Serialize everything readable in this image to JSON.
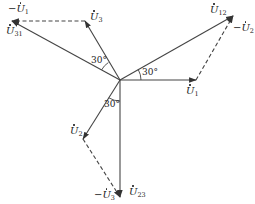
{
  "diagram": {
    "type": "phasor-diagram",
    "origin": [
      120,
      80
    ],
    "stroke_color": "#444444",
    "phasors": [
      {
        "id": "U1",
        "label_prefix": "",
        "label_sub": "1",
        "from": [
          120,
          80
        ],
        "to": [
          196,
          80
        ],
        "style": "solid"
      },
      {
        "id": "U2",
        "label_prefix": "",
        "label_sub": "2",
        "from": [
          120,
          80
        ],
        "to": [
          83,
          139
        ],
        "style": "solid"
      },
      {
        "id": "U3",
        "label_prefix": "",
        "label_sub": "3",
        "from": [
          120,
          80
        ],
        "to": [
          85,
          21
        ],
        "style": "solid"
      },
      {
        "id": "U12",
        "label_prefix": "",
        "label_sub": "12",
        "from": [
          120,
          80
        ],
        "to": [
          233,
          16
        ],
        "style": "solid"
      },
      {
        "id": "U23",
        "label_prefix": "",
        "label_sub": "23",
        "from": [
          120,
          80
        ],
        "to": [
          120,
          197
        ],
        "style": "solid"
      },
      {
        "id": "U31",
        "label_prefix": "",
        "label_sub": "31",
        "from": [
          120,
          80
        ],
        "to": [
          12,
          21
        ],
        "style": "solid"
      },
      {
        "id": "-U2",
        "label_prefix": "−",
        "label_sub": "2",
        "from": [
          196,
          80
        ],
        "to": [
          233,
          16
        ],
        "style": "dashed"
      },
      {
        "id": "-U3",
        "label_prefix": "−",
        "label_sub": "3",
        "from": [
          83,
          139
        ],
        "to": [
          120,
          197
        ],
        "style": "dashed"
      },
      {
        "id": "-U1",
        "label_prefix": "−",
        "label_sub": "1",
        "from": [
          85,
          21
        ],
        "to": [
          12,
          21
        ],
        "style": "dashed"
      }
    ],
    "labels": {
      "neg_u1": {
        "prefix": "−",
        "sub": "1"
      },
      "u31": {
        "prefix": "",
        "sub": "31"
      },
      "u3": {
        "prefix": "",
        "sub": "3"
      },
      "u12": {
        "prefix": "",
        "sub": "12"
      },
      "neg_u2": {
        "prefix": "−",
        "sub": "2"
      },
      "u1": {
        "prefix": "",
        "sub": "1"
      },
      "u2": {
        "prefix": "",
        "sub": "2"
      },
      "neg_u3": {
        "prefix": "−",
        "sub": "3"
      },
      "u23": {
        "prefix": "",
        "sub": "23"
      }
    },
    "angles": {
      "upper_left": "30°",
      "right": "30°",
      "lower": "30°"
    },
    "letter": "U"
  }
}
